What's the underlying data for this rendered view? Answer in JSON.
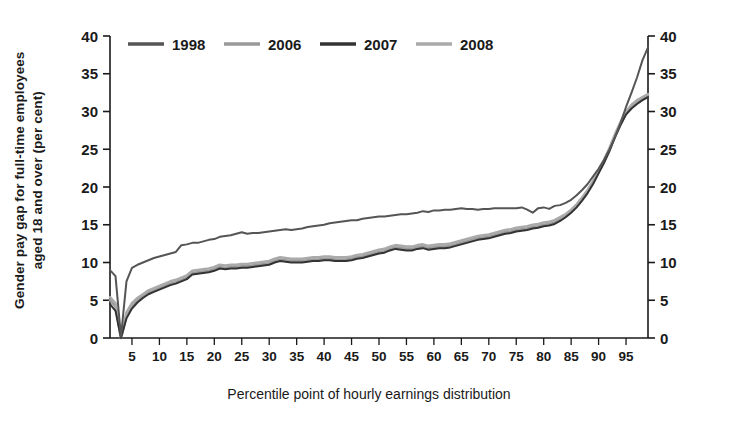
{
  "chart_data": {
    "type": "line",
    "title": "",
    "xlabel": "Percentile point of hourly earnings distribution",
    "ylabel": "Gender pay gap for full-time employees aged 18 and over (per cent)",
    "ylabel_line1": "Gender pay gap for full-time employees",
    "ylabel_line2": "aged 18 and over (per cent)",
    "xlim": [
      1,
      99
    ],
    "ylim": [
      0,
      40
    ],
    "grid": false,
    "legend_position": "top-left-inside",
    "dual_y_axis": true,
    "y_ticks": [
      0,
      5,
      10,
      15,
      20,
      25,
      30,
      35,
      40
    ],
    "y_tick_labels": [
      "0",
      "5",
      "10",
      "15",
      "20",
      "25",
      "30",
      "35",
      "40"
    ],
    "y_ticks_right": [
      0,
      5,
      10,
      15,
      20,
      25,
      30,
      35,
      40
    ],
    "y_tick_labels_right": [
      "0",
      "5",
      "10",
      "15",
      "20",
      "25",
      "30",
      "35",
      "40"
    ],
    "x_ticks": [
      5,
      10,
      15,
      20,
      25,
      30,
      35,
      40,
      45,
      50,
      55,
      60,
      65,
      70,
      75,
      80,
      85,
      90,
      95
    ],
    "x_tick_labels": [
      "5",
      "10",
      "15",
      "20",
      "25",
      "30",
      "35",
      "40",
      "45",
      "50",
      "55",
      "60",
      "65",
      "70",
      "75",
      "80",
      "85",
      "90",
      "95"
    ],
    "x": [
      1,
      2,
      3,
      4,
      5,
      6,
      7,
      8,
      9,
      10,
      11,
      12,
      13,
      14,
      15,
      16,
      17,
      18,
      19,
      20,
      21,
      22,
      23,
      24,
      25,
      26,
      27,
      28,
      29,
      30,
      31,
      32,
      33,
      34,
      35,
      36,
      37,
      38,
      39,
      40,
      41,
      42,
      43,
      44,
      45,
      46,
      47,
      48,
      49,
      50,
      51,
      52,
      53,
      54,
      55,
      56,
      57,
      58,
      59,
      60,
      61,
      62,
      63,
      64,
      65,
      66,
      67,
      68,
      69,
      70,
      71,
      72,
      73,
      74,
      75,
      76,
      77,
      78,
      79,
      80,
      81,
      82,
      83,
      84,
      85,
      86,
      87,
      88,
      89,
      90,
      91,
      92,
      93,
      94,
      95,
      96,
      97,
      98,
      99
    ],
    "series": [
      {
        "name": "1998",
        "color": "#555555",
        "values": [
          9.0,
          8.2,
          0.2,
          7.5,
          9.3,
          9.7,
          10.0,
          10.3,
          10.6,
          10.8,
          11.0,
          11.2,
          11.4,
          12.3,
          12.4,
          12.6,
          12.6,
          12.8,
          13.0,
          13.1,
          13.4,
          13.5,
          13.6,
          13.8,
          14.0,
          13.8,
          13.9,
          13.9,
          14.0,
          14.1,
          14.2,
          14.3,
          14.4,
          14.3,
          14.4,
          14.5,
          14.7,
          14.8,
          14.9,
          15.0,
          15.2,
          15.3,
          15.4,
          15.5,
          15.6,
          15.6,
          15.8,
          15.9,
          16.0,
          16.1,
          16.1,
          16.2,
          16.3,
          16.4,
          16.4,
          16.5,
          16.6,
          16.8,
          16.7,
          16.9,
          16.9,
          17.0,
          17.0,
          17.1,
          17.2,
          17.1,
          17.1,
          17.0,
          17.1,
          17.1,
          17.2,
          17.2,
          17.2,
          17.2,
          17.2,
          17.3,
          17.0,
          16.6,
          17.2,
          17.3,
          17.1,
          17.5,
          17.6,
          17.9,
          18.3,
          18.9,
          19.6,
          20.4,
          21.4,
          22.4,
          23.6,
          25.0,
          26.6,
          28.5,
          30.6,
          32.5,
          34.5,
          36.8,
          38.5
        ]
      },
      {
        "name": "2006",
        "color": "#999999",
        "values": [
          5.0,
          4.2,
          0.0,
          3.0,
          4.2,
          5.0,
          5.5,
          6.0,
          6.3,
          6.6,
          6.9,
          7.2,
          7.4,
          7.7,
          8.0,
          8.6,
          8.7,
          8.8,
          8.9,
          9.1,
          9.4,
          9.3,
          9.4,
          9.4,
          9.5,
          9.5,
          9.6,
          9.7,
          9.8,
          9.9,
          10.2,
          10.4,
          10.3,
          10.2,
          10.2,
          10.2,
          10.3,
          10.4,
          10.4,
          10.5,
          10.5,
          10.4,
          10.4,
          10.4,
          10.5,
          10.7,
          10.8,
          11.0,
          11.2,
          11.4,
          11.5,
          11.8,
          12.0,
          11.9,
          11.8,
          11.8,
          12.0,
          12.1,
          11.9,
          12.0,
          12.1,
          12.1,
          12.2,
          12.4,
          12.6,
          12.8,
          13.0,
          13.2,
          13.3,
          13.4,
          13.6,
          13.8,
          14.0,
          14.1,
          14.3,
          14.4,
          14.5,
          14.7,
          14.8,
          15.0,
          15.1,
          15.3,
          15.7,
          16.2,
          16.8,
          17.5,
          18.4,
          19.4,
          20.6,
          22.0,
          23.4,
          25.0,
          26.8,
          28.4,
          29.8,
          30.6,
          31.2,
          31.6,
          32.0
        ]
      },
      {
        "name": "2007",
        "color": "#333333",
        "values": [
          4.5,
          3.6,
          0.0,
          2.6,
          3.9,
          4.7,
          5.3,
          5.8,
          6.1,
          6.4,
          6.7,
          7.0,
          7.2,
          7.5,
          7.8,
          8.4,
          8.5,
          8.6,
          8.7,
          8.9,
          9.2,
          9.1,
          9.2,
          9.2,
          9.3,
          9.3,
          9.4,
          9.5,
          9.6,
          9.7,
          10.0,
          10.2,
          10.1,
          10.0,
          10.0,
          10.0,
          10.1,
          10.2,
          10.2,
          10.3,
          10.3,
          10.2,
          10.2,
          10.2,
          10.3,
          10.5,
          10.6,
          10.8,
          11.0,
          11.2,
          11.3,
          11.6,
          11.8,
          11.7,
          11.6,
          11.6,
          11.8,
          11.9,
          11.7,
          11.8,
          11.9,
          11.9,
          12.0,
          12.2,
          12.4,
          12.6,
          12.8,
          13.0,
          13.1,
          13.2,
          13.4,
          13.6,
          13.8,
          13.9,
          14.1,
          14.2,
          14.3,
          14.5,
          14.6,
          14.8,
          14.9,
          15.1,
          15.5,
          16.0,
          16.6,
          17.3,
          18.2,
          19.2,
          20.4,
          21.8,
          23.2,
          24.8,
          26.6,
          28.2,
          29.6,
          30.4,
          31.0,
          31.5,
          31.9
        ]
      },
      {
        "name": "2008",
        "color": "#aaaaaa",
        "values": [
          5.4,
          4.6,
          0.3,
          3.4,
          4.6,
          5.3,
          5.8,
          6.3,
          6.6,
          6.9,
          7.2,
          7.5,
          7.7,
          8.0,
          8.3,
          8.9,
          9.0,
          9.1,
          9.2,
          9.4,
          9.7,
          9.6,
          9.7,
          9.7,
          9.8,
          9.8,
          9.9,
          10.0,
          10.1,
          10.2,
          10.5,
          10.7,
          10.6,
          10.5,
          10.5,
          10.5,
          10.6,
          10.7,
          10.7,
          10.8,
          10.8,
          10.7,
          10.7,
          10.7,
          10.8,
          11.0,
          11.1,
          11.3,
          11.5,
          11.7,
          11.8,
          12.1,
          12.3,
          12.2,
          12.1,
          12.1,
          12.3,
          12.4,
          12.2,
          12.3,
          12.4,
          12.4,
          12.5,
          12.7,
          12.9,
          13.1,
          13.3,
          13.5,
          13.6,
          13.7,
          13.9,
          14.1,
          14.3,
          14.4,
          14.6,
          14.7,
          14.8,
          15.0,
          15.1,
          15.3,
          15.4,
          15.6,
          16.0,
          16.4,
          17.0,
          17.7,
          18.6,
          19.6,
          20.8,
          22.2,
          23.6,
          25.2,
          27.0,
          28.6,
          30.0,
          30.9,
          31.5,
          31.9,
          32.3
        ]
      }
    ]
  },
  "legend": {
    "items": [
      {
        "label": "1998",
        "color": "#555555"
      },
      {
        "label": "2006",
        "color": "#999999"
      },
      {
        "label": "2007",
        "color": "#333333"
      },
      {
        "label": "2008",
        "color": "#aaaaaa"
      }
    ]
  }
}
